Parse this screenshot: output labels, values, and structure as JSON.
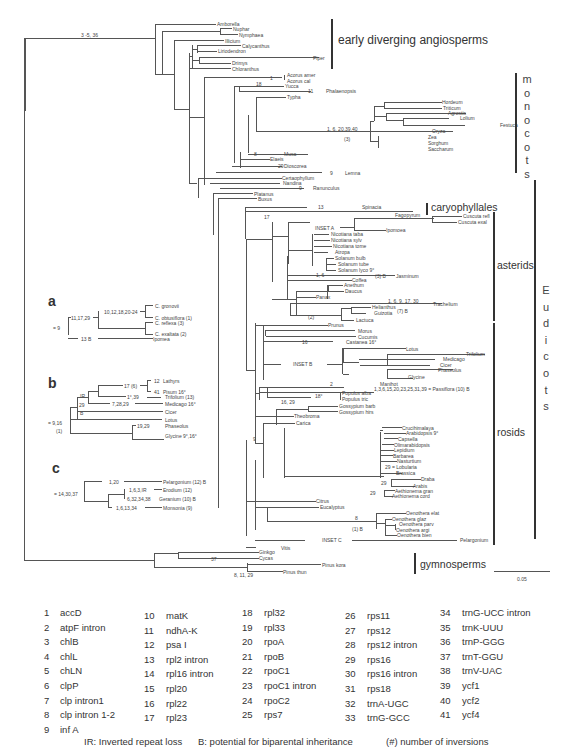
{
  "figure": {
    "root_label": "3 -5, 36",
    "groups": {
      "early": "early diverging angiosperms",
      "monocots": [
        "m",
        "o",
        "n",
        "o",
        "c",
        "o",
        "t",
        "s"
      ],
      "caryophyllales": "caryophyllales",
      "asterids": "asterids",
      "eudicots": [
        "E",
        "u",
        "d",
        "i",
        "c",
        "o",
        "t",
        "s"
      ],
      "rosids": "rosids",
      "gymnosperms": "gymnosperms"
    },
    "scale_bar": "0.05",
    "taxa": {
      "amborella": "Amborella",
      "nuphar": "Nuphar",
      "nymphaea": "Nymphaea",
      "illicium": "Illicium",
      "calycanthus": "Calycanthus",
      "liriodendron": "Liriodendron",
      "piper": "Piper",
      "drimys": "Drimys",
      "chloranthus": "Chloranthus",
      "acorus_amer": "Acorus amer",
      "acorus_cal": "Acorus cal",
      "yucca": "Yucca",
      "phalaenopsis": "Phalaenopsis",
      "typha": "Typha",
      "hordeum": "Hordeum",
      "triticum": "Triticum",
      "agrostis": "Agrostis",
      "lolium": "Lolium",
      "festuca": "Festuca",
      "oryza": "Oryza",
      "zea": "Zea",
      "sorghum": "Sorghum",
      "saccharum": "Saccharum",
      "musa": "Musa",
      "elaeis": "Elaeis",
      "dioscorea": "Dioscorea",
      "lemna": "Lemna",
      "ceratophyllum": "Certaophyllum",
      "nandina": "Nandina",
      "ranunculus": "Ranunculus",
      "platanus": "Platanus",
      "buxus": "Buxus",
      "spinacia": "Spinacia",
      "fagopyrum": "Fagopyrum",
      "cuscuta_refl": "Cuscuta refl",
      "cuscuta_exal": "Cuscuta exal",
      "inset_a": "INSET A",
      "ipomoea": "Ipomoea",
      "nic_taba": "Nicotiana taba",
      "nic_sylv": "Nicotiana sylv",
      "nic_tome": "Nicotiana tome",
      "atropa": "Atropa",
      "sol_bulb": "Solanum bulb",
      "sol_tube": "Solanum tube",
      "sol_lyco": "Solanum lyco 9°",
      "jasminum": "Jasminum",
      "coffea": "Coffea",
      "anethum": "Anethum",
      "daucus": "Daucus",
      "panax": "Panax",
      "trachelium": "Trachelium",
      "helianthus": "Helianthus",
      "guizotia": "Guizotia",
      "lactuca": "Lactuca",
      "prunus": "Prunus",
      "morus": "Morus",
      "cucumis": "Cucumis",
      "castanea": "Castanea 16°",
      "inset_b": "INSET B",
      "lotus": "Lotus",
      "trifolium": "Trifolium",
      "medicago": "Medicago",
      "cicer": "Cicer",
      "phaseolus": "Phaseolus",
      "glycine": "Glycine",
      "manihot": "Manihot",
      "passiflora": "1,3,6,15,20,23,25,31,39 = Passiflora (10) B",
      "populus_alba": "Populus alba",
      "populus_tric": "Populus tric",
      "gossypium_barb": "Gossypium barb",
      "gossypium_hirs": "Gossypium hirs",
      "theobroma": "Theobroma",
      "carica": "Carica",
      "crucihimalaya": "Crucihimalaya",
      "arabidopsis": "Arabidopsis 9°",
      "capsella": "Capsella",
      "olimarabidopsis": "Olimarabidopsis",
      "lepidium": "Lepidium",
      "barbarea": "Barbarea",
      "nasturtium": "Nasturtium",
      "lobularia": "29 = Lobularia",
      "brassica": "Brassica",
      "draba": "Draba",
      "arabis": "Arabis",
      "aeth_gran": "Aethionema gran",
      "aeth_cord": "Aethionema cord",
      "citrus": "Citrus",
      "eucalyptus": "Eucalyptus",
      "oeno_elat": "Oenothera elat",
      "oeno_glaz": "Oenothera glaz",
      "oeno_parv": "Oenothera parv",
      "oeno_argi": "Oenothera argi",
      "oeno_bien": "Oenothera bien",
      "inset_c": "INSET C",
      "pelargonium": "Pelargonium",
      "vitis": "Vitis",
      "ginkgo": "Ginkgo",
      "cycas": "Cycas",
      "pinus_kora": "Pinus kora",
      "pinus_thun": "Pinus thun"
    },
    "branch_labels": {
      "acorus": "1",
      "yucca": "18",
      "phal": "11",
      "poaceae": "1, 6, 20,39,40",
      "poaceae_inv": "(3)",
      "musa": "8",
      "dioscorea": "29",
      "lemna": "9",
      "ranunculus": "9",
      "spinacia": "13",
      "caryo": "17",
      "jasm": "1, 6",
      "jasm2": "(3) B",
      "trach": "1, 6, 9, 17, 30",
      "trach2": "(7) B",
      "aster_inv": "(2)",
      "castanea": "16",
      "manihot": "2",
      "populus": "18°",
      "rosid_node": "16, 29",
      "rosid_base": "9",
      "draba": "29",
      "aeth": "29",
      "oeno": "8",
      "oeno2": "(1) B",
      "cycas": "37",
      "gymno": "8, 11, 29"
    },
    "insets": {
      "a": {
        "label": "a",
        "root": "= 9",
        "n1": "11,17,29",
        "n2": "10,12,18,20-24",
        "n3": "13 B",
        "taxa": [
          "C. gronovii",
          "C. obtusiflora (1)",
          "C. reflexa (3)",
          "C. exaltata (2)",
          "Ipomea"
        ]
      },
      "b": {
        "label": "b",
        "root": "= 9,16",
        "root2": "(1)",
        "ir": "IR",
        "n29": "29",
        "nb": "B",
        "n17": "17 (6)",
        "n12": "12",
        "n41": "41",
        "n1": "1°,39",
        "n7": "7,28,29",
        "n19": "19,29",
        "taxa": [
          "Lathyrs",
          "Pisum 16°",
          "Trifolium (13)",
          "Medicago 16°",
          "Cicer",
          "Lotus",
          "Phaseolus",
          "Glycine 9°,16°"
        ]
      },
      "c": {
        "label": "c",
        "root": "= 14,30,37",
        "n1": "1,20",
        "n2": "1,6,3,IR",
        "n3": "6,32,34,38",
        "n4": "1,6,13,34",
        "taxa": [
          "Pelargonium (12) B",
          "Erodium (12)",
          "Geranium (10) B",
          "Monsonia (9)"
        ]
      }
    }
  },
  "legend": {
    "col1": [
      {
        "n": "1",
        "g": "accD"
      },
      {
        "n": "2",
        "g": "atpF intron"
      },
      {
        "n": "3",
        "g": "chlB"
      },
      {
        "n": "4",
        "g": "chlL"
      },
      {
        "n": "5",
        "g": "chLN"
      },
      {
        "n": "6",
        "g": "clpP"
      },
      {
        "n": "7",
        "g": "clp intron1"
      },
      {
        "n": "8",
        "g": "clp intron 1-2"
      },
      {
        "n": "9",
        "g": "inf A"
      }
    ],
    "col2": [
      {
        "n": "10",
        "g": "matK"
      },
      {
        "n": "11",
        "g": "ndhA-K"
      },
      {
        "n": "12",
        "g": "psa I"
      },
      {
        "n": "13",
        "g": "rpl2 intron"
      },
      {
        "n": "14",
        "g": "rpl16 intron"
      },
      {
        "n": "15",
        "g": "rpl20"
      },
      {
        "n": "16",
        "g": "rpl22"
      },
      {
        "n": "17",
        "g": "rpl23"
      }
    ],
    "col3": [
      {
        "n": "18",
        "g": "rpl32"
      },
      {
        "n": "19",
        "g": "rpl33"
      },
      {
        "n": "20",
        "g": "rpoA"
      },
      {
        "n": "21",
        "g": "rpoB"
      },
      {
        "n": "22",
        "g": "rpoC1"
      },
      {
        "n": "23",
        "g": "rpoC1 intron"
      },
      {
        "n": "24",
        "g": "rpoC2"
      },
      {
        "n": "25",
        "g": "rps7"
      }
    ],
    "col4": [
      {
        "n": "26",
        "g": "rps11"
      },
      {
        "n": "27",
        "g": "rps12"
      },
      {
        "n": "28",
        "g": "rps12 intron"
      },
      {
        "n": "29",
        "g": "rps16"
      },
      {
        "n": "30",
        "g": "rps16 intron"
      },
      {
        "n": "31",
        "g": "rps18"
      },
      {
        "n": "32",
        "g": "trnA-UGC"
      },
      {
        "n": "33",
        "g": "trnG-GCC"
      }
    ],
    "col5": [
      {
        "n": "34",
        "g": "trnG-UCC intron"
      },
      {
        "n": "35",
        "g": "trnK-UUU"
      },
      {
        "n": "36",
        "g": "trnP-GGG"
      },
      {
        "n": "37",
        "g": "trnT-GGU"
      },
      {
        "n": "38",
        "g": "trnV-UAC"
      },
      {
        "n": "39",
        "g": "ycf1"
      },
      {
        "n": "40",
        "g": "ycf2"
      },
      {
        "n": "41",
        "g": "ycf4"
      }
    ],
    "footer": {
      "ir": "IR: Inverted repeat loss",
      "b": "B: potential for biparental inheritance",
      "inv": "(#) number of inversions"
    }
  }
}
